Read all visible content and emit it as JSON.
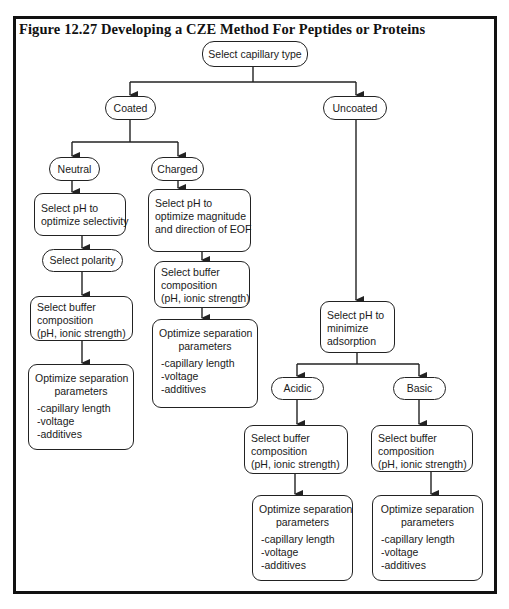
{
  "figure": {
    "title": "Figure 12.27  Developing a CZE Method For Peptides or Proteins"
  },
  "nodes": {
    "root": {
      "label": "Select capillary type"
    },
    "coated": {
      "label": "Coated"
    },
    "uncoated": {
      "label": "Uncoated"
    },
    "neutral": {
      "label": "Neutral"
    },
    "charged": {
      "label": "Charged"
    },
    "neutral_ph": {
      "lines": [
        "Select pH to",
        "optimize selectivity"
      ]
    },
    "neutral_polarity": {
      "label": "Select polarity"
    },
    "neutral_buffer": {
      "lines": [
        "Select buffer",
        "composition",
        "(pH, ionic strength)"
      ]
    },
    "neutral_optimize": {
      "heading": [
        "Optimize separation",
        "parameters"
      ],
      "items": [
        "-capillary length",
        "-voltage",
        "-additives"
      ]
    },
    "charged_ph": {
      "lines": [
        "Select pH to",
        "optimize  magnitude",
        "and direction of EOF"
      ]
    },
    "charged_buffer": {
      "lines": [
        "Select buffer",
        "composition",
        "(pH, ionic strength)"
      ]
    },
    "charged_optimize": {
      "heading": [
        "Optimize separation",
        "parameters"
      ],
      "items": [
        "-capillary length",
        "-voltage",
        "-additives"
      ]
    },
    "uncoated_ph": {
      "lines": [
        "Select pH to",
        "minimize",
        "adsorption"
      ]
    },
    "acidic": {
      "label": "Acidic"
    },
    "basic": {
      "label": "Basic"
    },
    "acidic_buffer": {
      "lines": [
        "Select buffer",
        "composition",
        "(pH, ionic strength)"
      ]
    },
    "acidic_optimize": {
      "heading": [
        "Optimize separation",
        "parameters"
      ],
      "items": [
        "-capillary length",
        "-voltage",
        "-additives"
      ]
    },
    "basic_buffer": {
      "lines": [
        "Select buffer",
        "composition",
        "(pH, ionic strength)"
      ]
    },
    "basic_optimize": {
      "heading": [
        "Optimize separation",
        "parameters"
      ],
      "items": [
        "-capillary length",
        "-voltage",
        "-additives"
      ]
    }
  },
  "edges": [
    [
      "root",
      "coated"
    ],
    [
      "root",
      "uncoated"
    ],
    [
      "coated",
      "neutral"
    ],
    [
      "coated",
      "charged"
    ],
    [
      "neutral",
      "neutral_ph"
    ],
    [
      "neutral_ph",
      "neutral_polarity"
    ],
    [
      "neutral_polarity",
      "neutral_buffer"
    ],
    [
      "neutral_buffer",
      "neutral_optimize"
    ],
    [
      "charged",
      "charged_ph"
    ],
    [
      "charged_ph",
      "charged_buffer"
    ],
    [
      "charged_buffer",
      "charged_optimize"
    ],
    [
      "uncoated",
      "uncoated_ph"
    ],
    [
      "uncoated_ph",
      "acidic"
    ],
    [
      "uncoated_ph",
      "basic"
    ],
    [
      "acidic",
      "acidic_buffer"
    ],
    [
      "acidic_buffer",
      "acidic_optimize"
    ],
    [
      "basic",
      "basic_buffer"
    ],
    [
      "basic_buffer",
      "basic_optimize"
    ]
  ],
  "colors": {
    "line": "#222222",
    "text": "#1a1a1a",
    "frame": "#111111",
    "background": "#ffffff"
  }
}
